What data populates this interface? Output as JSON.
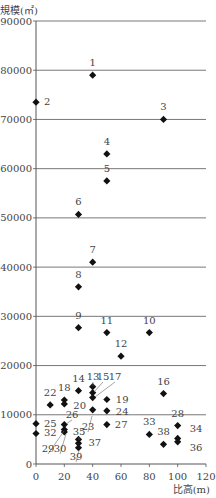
{
  "chart_data": {
    "type": "scatter",
    "title": "",
    "xlabel": "比高(m)",
    "ylabel": "規模(㎡)",
    "xlim": [
      0,
      120
    ],
    "ylim": [
      0,
      90000
    ],
    "x_ticks": [
      0,
      20,
      40,
      60,
      80,
      100,
      120
    ],
    "y_ticks": [
      0,
      10000,
      20000,
      30000,
      40000,
      50000,
      60000,
      70000,
      80000,
      90000
    ],
    "grid": "horizontal",
    "legend": "none",
    "marker": "diamond",
    "points": [
      {
        "id": 1,
        "x": 40,
        "y": 79000
      },
      {
        "id": 2,
        "x": 0,
        "y": 73500
      },
      {
        "id": 3,
        "x": 90,
        "y": 70000
      },
      {
        "id": 4,
        "x": 50,
        "y": 63000
      },
      {
        "id": 5,
        "x": 50,
        "y": 57500
      },
      {
        "id": 6,
        "x": 30,
        "y": 50700
      },
      {
        "id": 7,
        "x": 40,
        "y": 41000
      },
      {
        "id": 8,
        "x": 30,
        "y": 36000
      },
      {
        "id": 9,
        "x": 30,
        "y": 27700
      },
      {
        "id": 10,
        "x": 80,
        "y": 26700
      },
      {
        "id": 11,
        "x": 50,
        "y": 26700
      },
      {
        "id": 12,
        "x": 60,
        "y": 21900
      },
      {
        "id": 13,
        "x": 40,
        "y": 15700
      },
      {
        "id": 14,
        "x": 30,
        "y": 14900
      },
      {
        "id": 15,
        "x": 40,
        "y": 14500
      },
      {
        "id": 16,
        "x": 90,
        "y": 14300
      },
      {
        "id": 17,
        "x": 40,
        "y": 13500
      },
      {
        "id": 18,
        "x": 20,
        "y": 13000
      },
      {
        "id": 19,
        "x": 50,
        "y": 13100
      },
      {
        "id": 20,
        "x": 20,
        "y": 12200
      },
      {
        "id": 22,
        "x": 10,
        "y": 12000
      },
      {
        "id": 23,
        "x": 40,
        "y": 11000
      },
      {
        "id": 24,
        "x": 50,
        "y": 10800
      },
      {
        "id": 25,
        "x": 0,
        "y": 8200
      },
      {
        "id": 26,
        "x": 20,
        "y": 8000
      },
      {
        "id": 27,
        "x": 50,
        "y": 8000
      },
      {
        "id": 28,
        "x": 100,
        "y": 7800
      },
      {
        "id": 29,
        "x": 20,
        "y": 7000
      },
      {
        "id": 30,
        "x": 20,
        "y": 6500
      },
      {
        "id": 32,
        "x": 0,
        "y": 6200
      },
      {
        "id": 33,
        "x": 80,
        "y": 6000
      },
      {
        "id": 34,
        "x": 100,
        "y": 5200
      },
      {
        "id": 35,
        "x": 30,
        "y": 5000
      },
      {
        "id": 36,
        "x": 100,
        "y": 4500
      },
      {
        "id": 37,
        "x": 30,
        "y": 4200
      },
      {
        "id": 38,
        "x": 90,
        "y": 4000
      },
      {
        "id": 39,
        "x": 30,
        "y": 3300
      }
    ],
    "label_offsets": {
      "1": [
        0,
        -9
      ],
      "2": [
        8,
        3
      ],
      "3": [
        0,
        -9
      ],
      "4": [
        0,
        -9
      ],
      "5": [
        0,
        -9
      ],
      "6": [
        0,
        -9
      ],
      "7": [
        0,
        -9
      ],
      "8": [
        0,
        -9
      ],
      "9": [
        0,
        -9
      ],
      "10": [
        0,
        -9
      ],
      "11": [
        0,
        -9
      ],
      "12": [
        0,
        -9
      ],
      "14": [
        0,
        -9
      ],
      "16": [
        0,
        -9
      ],
      "18": [
        0,
        -9
      ],
      "19": [
        9,
        3
      ],
      "20": [
        9,
        5
      ],
      "22": [
        0,
        -9
      ],
      "24": [
        9,
        4
      ],
      "25": [
        8,
        3
      ],
      "27": [
        8,
        3
      ],
      "28": [
        0,
        -9
      ],
      "32": [
        8,
        3
      ],
      "33": [
        0,
        -9
      ],
      "34": [
        12,
        -6
      ],
      "36": [
        12,
        9
      ],
      "37": [
        10,
        3
      ],
      "38": [
        0,
        -9
      ]
    },
    "leader_labels": [
      {
        "text": "13",
        "lx": 93,
        "ly": 380,
        "px": 93,
        "py": 386
      },
      {
        "text": "15",
        "lx": 103,
        "ly": 380,
        "px": 94,
        "py": 392
      },
      {
        "text": "17",
        "lx": 115,
        "ly": 380,
        "px": 95,
        "py": 397
      },
      {
        "text": "23",
        "lx": 88,
        "ly": 430,
        "px": 92,
        "py": 416
      },
      {
        "text": "26",
        "lx": 72,
        "ly": 418,
        "px": 66,
        "py": 424
      },
      {
        "text": "29",
        "lx": 48,
        "ly": 452,
        "px": 64,
        "py": 431
      },
      {
        "text": "30",
        "lx": 60,
        "ly": 452,
        "px": 66,
        "py": 434
      },
      {
        "text": "35",
        "lx": 79,
        "ly": 435,
        "px": 79,
        "py": 440
      },
      {
        "text": "39",
        "lx": 76,
        "ly": 460,
        "px": 79,
        "py": 450
      }
    ]
  }
}
